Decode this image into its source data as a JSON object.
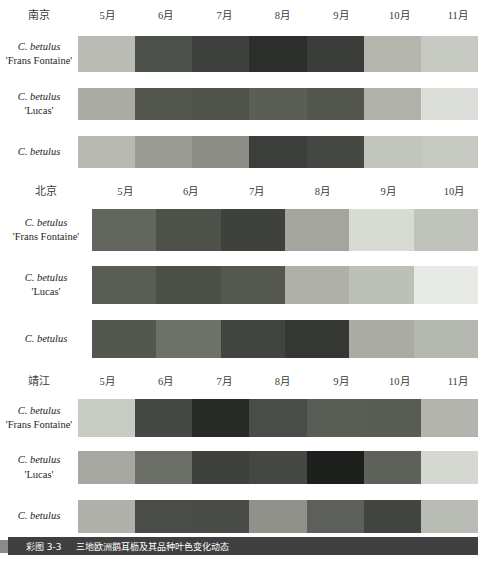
{
  "chart_data": {
    "type": "heatmap",
    "title": "三地欧洲鹅耳枥及其品种叶色变化动态",
    "figure_number": "彩图 3-3",
    "xlabel": "",
    "ylabel": "",
    "legend": "",
    "grid": false,
    "note": "Leaf-colour dynamics shown as month-by-month colour swatch strips; each swatch is the mean leaf colour for that month rendered in greyscale.",
    "panels": [
      {
        "site": "南京",
        "categories": [
          "5月",
          "6月",
          "7月",
          "8月",
          "9月",
          "10月",
          "11月"
        ],
        "series": [
          {
            "name": "C. betulus 'Frans Fontaine'",
            "taxon": "C. betulus",
            "cultivar": "'Frans Fontaine'",
            "colors": [
              "#b9bbb4",
              "#4d514c",
              "#3d403c",
              "#2b2e2a",
              "#3a3d39",
              "#b4b6ae",
              "#c6c8c2"
            ],
            "values": [
              73,
              31,
              25,
              18,
              24,
              71,
              78
            ]
          },
          {
            "name": "C. betulus 'Lucas'",
            "taxon": "C. betulus",
            "cultivar": "'Lucas'",
            "colors": [
              "#a9aba4",
              "#54574f",
              "#4f524b",
              "#5b5e56",
              "#53564e",
              "#b0b2ab",
              "#dcded9"
            ],
            "values": [
              66,
              34,
              32,
              36,
              33,
              69,
              87
            ]
          },
          {
            "name": "C. betulus",
            "taxon": "C. betulus",
            "cultivar": "",
            "colors": [
              "#b7b9b2",
              "#9a9c95",
              "#8b8d86",
              "#3b3e3a",
              "#444742",
              "#c2c4be",
              "#c6c8c2"
            ],
            "values": [
              72,
              61,
              55,
              24,
              28,
              76,
              78
            ]
          }
        ]
      },
      {
        "site": "北京",
        "categories": [
          "5月",
          "6月",
          "7月",
          "8月",
          "9月",
          "10月"
        ],
        "series": [
          {
            "name": "C. betulus 'Frans Fontaine'",
            "taxon": "C. betulus",
            "cultivar": "'Frans Fontaine'",
            "colors": [
              "#63665f",
              "#4e514a",
              "#3e413c",
              "#a3a59e",
              "#d8dad4",
              "#c0c2bc"
            ],
            "values": [
              40,
              31,
              25,
              64,
              85,
              76
            ]
          },
          {
            "name": "C. betulus 'Lucas'",
            "taxon": "C. betulus",
            "cultivar": "'Lucas'",
            "colors": [
              "#5a5d56",
              "#4c4f48",
              "#555851",
              "#aeb0a9",
              "#bdbfb9",
              "#e8eae6"
            ],
            "values": [
              36,
              30,
              34,
              69,
              75,
              91
            ]
          },
          {
            "name": "C. betulus",
            "taxon": "C. betulus",
            "cultivar": "",
            "colors": [
              "#54574f",
              "#6e716a",
              "#42453f",
              "#343732",
              "#a9aba4",
              "#b5b7b1"
            ],
            "values": [
              34,
              44,
              27,
              21,
              67,
              72
            ]
          }
        ]
      },
      {
        "site": "靖江",
        "categories": [
          "5月",
          "6月",
          "7月",
          "8月",
          "9月",
          "10月",
          "11月"
        ],
        "series": [
          {
            "name": "C. betulus 'Frans Fontaine'",
            "taxon": "C. betulus",
            "cultivar": "'Frans Fontaine'",
            "colors": [
              "#c8cac4",
              "#454843",
              "#262925",
              "#4a4d47",
              "#5a5d56",
              "#595c55",
              "#b2b4ad"
            ],
            "values": [
              79,
              28,
              16,
              30,
              36,
              36,
              70
            ]
          },
          {
            "name": "C. betulus 'Lucas'",
            "taxon": "C. betulus",
            "cultivar": "'Lucas'",
            "colors": [
              "#a5a7a0",
              "#6b6e67",
              "#3d403b",
              "#444742",
              "#1c1f1b",
              "#5e615a",
              "#d5d7d1"
            ],
            "values": [
              65,
              43,
              25,
              28,
              12,
              38,
              84
            ]
          },
          {
            "name": "C. betulus",
            "taxon": "C. betulus",
            "cultivar": "",
            "colors": [
              "#aeb0a9",
              "#4a4d47",
              "#484b45",
              "#8f918a",
              "#5d605a",
              "#42453f",
              "#b9bbb5"
            ],
            "values": [
              69,
              30,
              29,
              57,
              38,
              27,
              73
            ]
          }
        ]
      }
    ]
  },
  "caption": {
    "number": "彩图 3-3",
    "text": "三地欧洲鹅耳枥及其品种叶色变化动态"
  }
}
